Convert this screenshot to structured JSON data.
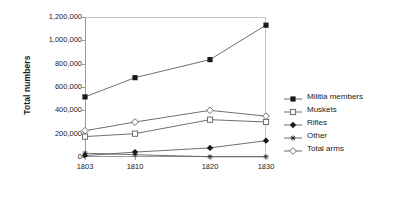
{
  "chart_data": {
    "type": "line",
    "title": "",
    "xlabel": "",
    "ylabel": "Total numbers",
    "categories": [
      "1803",
      "1810",
      "1820",
      "1830"
    ],
    "x": [
      1803,
      1810,
      1820,
      1830
    ],
    "ylim": [
      0,
      1200000
    ],
    "xlim": [
      1803,
      1830
    ],
    "grid": false,
    "legend_position": "right",
    "y_ticks": [
      0,
      200000,
      400000,
      600000,
      800000,
      1000000,
      1200000
    ],
    "y_tick_labels": [
      "0",
      "200,000",
      "400,000",
      "600,000",
      "800,000",
      "1,000,000",
      "1,200,000"
    ],
    "series": [
      {
        "name": "Militia members",
        "marker": "filled-square",
        "values": [
          515000,
          680000,
          835000,
          1130000
        ]
      },
      {
        "name": "Muskets",
        "marker": "open-square",
        "values": [
          175000,
          200000,
          320000,
          300000
        ]
      },
      {
        "name": "Rifles",
        "marker": "filled-diamond",
        "values": [
          12000,
          42000,
          78000,
          140000
        ]
      },
      {
        "name": "Other",
        "marker": "star",
        "values": [
          32000,
          20000,
          2000,
          2000
        ]
      },
      {
        "name": "Total arms",
        "marker": "open-diamond",
        "values": [
          225000,
          300000,
          400000,
          350000
        ]
      }
    ]
  },
  "axis": {
    "y_title": "Total numbers"
  }
}
